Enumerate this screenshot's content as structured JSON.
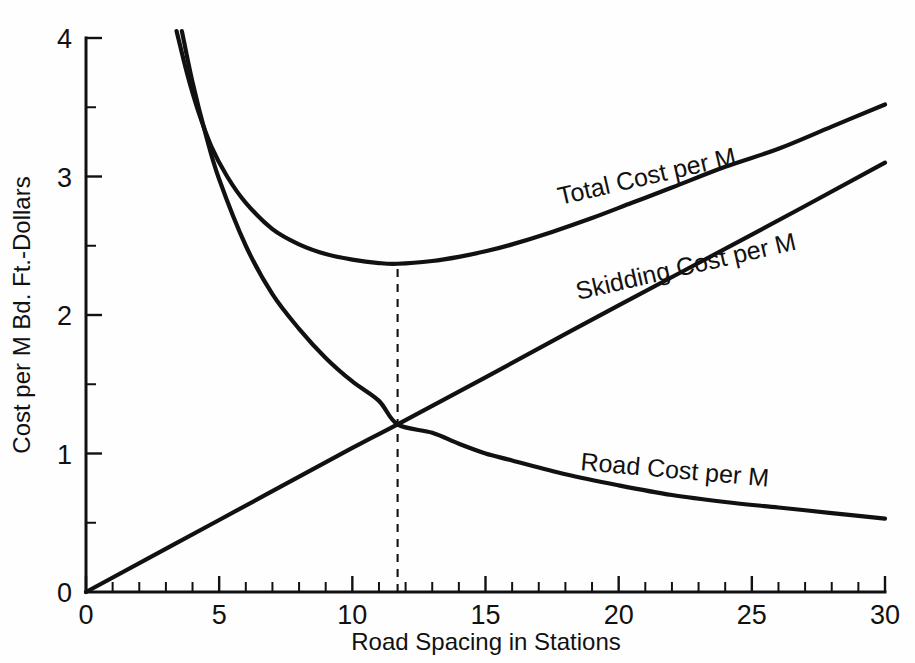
{
  "chart_data": {
    "type": "line",
    "title": "",
    "xlabel": "Road Spacing in Stations",
    "ylabel": "Cost per M  Bd.  Ft.-Dollars",
    "xlim": [
      0,
      30
    ],
    "ylim": [
      0,
      4
    ],
    "grid": false,
    "legend_position": "inline-curve-labels",
    "x_major_ticks": [
      0,
      5,
      10,
      15,
      20,
      25,
      30
    ],
    "x_minor_tick_step": 1,
    "y_major_ticks": [
      0,
      1,
      2,
      3,
      4
    ],
    "y_minor_tick_step": 0.5,
    "x_tick_labels": [
      "0",
      "5",
      "10",
      "15",
      "20",
      "25",
      "30"
    ],
    "y_tick_labels": [
      "0",
      "1",
      "2",
      "3",
      "4"
    ],
    "annotations": [
      {
        "name": "optimum-spacing-marker",
        "type": "vertical-dashed-line",
        "x": 11.7,
        "y_from": 0,
        "y_to": 2.37,
        "note": "Optimum road spacing: minimum of total cost, where road and skidding cost curves intersect"
      }
    ],
    "series": [
      {
        "name": "Total Cost per M",
        "label": "Total Cost per M",
        "label_rotation_deg": -13,
        "x": [
          3.4,
          3.8,
          4.2,
          4.7,
          5.3,
          6.0,
          7.0,
          8.0,
          9.0,
          10.0,
          11.0,
          11.7,
          13.0,
          14.0,
          15.0,
          16.0,
          17.5,
          19.0,
          20.5,
          22.0,
          24.0,
          26.0,
          28.0,
          30.0
        ],
        "y": [
          4.05,
          3.74,
          3.48,
          3.22,
          3.0,
          2.81,
          2.62,
          2.51,
          2.44,
          2.4,
          2.375,
          2.37,
          2.39,
          2.42,
          2.46,
          2.51,
          2.6,
          2.7,
          2.81,
          2.92,
          3.07,
          3.2,
          3.36,
          3.52
        ]
      },
      {
        "name": "Skidding Cost per M",
        "label": "Skidding Cost per M",
        "label_rotation_deg": -13,
        "x": [
          0,
          5,
          10,
          11.7,
          15,
          20,
          25,
          30
        ],
        "y": [
          0,
          0.52,
          1.04,
          1.21,
          1.55,
          2.07,
          2.58,
          3.1
        ]
      },
      {
        "name": "Road Cost per M",
        "label": "Road Cost per M",
        "label_rotation_deg": 5,
        "x": [
          3.6,
          4.0,
          4.5,
          5.0,
          6.0,
          7.0,
          8.0,
          9.0,
          10.0,
          11.0,
          11.7,
          13.0,
          14.0,
          15.0,
          16.0,
          18.0,
          20.0,
          22.0,
          24.0,
          26.0,
          28.0,
          30.0
        ],
        "y": [
          4.05,
          3.68,
          3.3,
          2.98,
          2.5,
          2.15,
          1.9,
          1.69,
          1.52,
          1.38,
          1.21,
          1.15,
          1.07,
          1.0,
          0.95,
          0.85,
          0.77,
          0.7,
          0.65,
          0.61,
          0.57,
          0.53
        ]
      }
    ]
  },
  "labels": {
    "x_axis_title": "Road Spacing in Stations",
    "y_axis_title": "Cost per M  Bd.  Ft.-Dollars",
    "series_total": "Total Cost per M",
    "series_skidding": "Skidding Cost per M",
    "series_road": "Road Cost per M"
  },
  "ticks": {
    "x": [
      "0",
      "5",
      "10",
      "15",
      "20",
      "25",
      "30"
    ],
    "y": [
      "0",
      "1",
      "2",
      "3",
      "4"
    ]
  },
  "colors": {
    "ink": "#111111",
    "background": "#ffffff"
  }
}
